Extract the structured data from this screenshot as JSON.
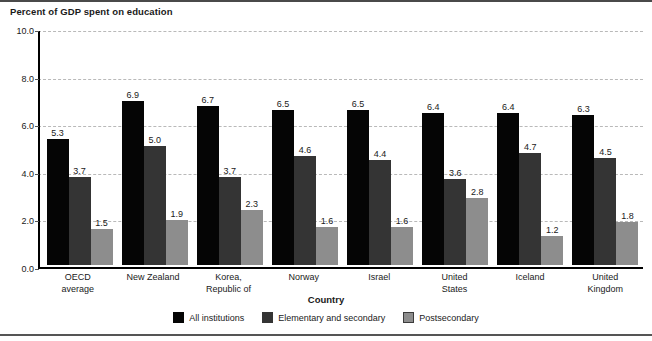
{
  "chart_data": {
    "type": "bar",
    "title": "Percent of GDP spent on education",
    "xlabel": "Country",
    "ylabel": "",
    "ylim": [
      0,
      10
    ],
    "yticks": [
      "0.0",
      "2.0",
      "4.0",
      "6.0",
      "8.0",
      "10.0"
    ],
    "ytick_values": [
      0,
      2,
      4,
      6,
      8,
      10
    ],
    "grid": true,
    "legend_position": "bottom",
    "categories": [
      "OECD average",
      "New Zealand",
      "Korea, Republic of",
      "Norway",
      "Israel",
      "United States",
      "Iceland",
      "United Kingdom"
    ],
    "category_lines": [
      [
        "OECD",
        "average"
      ],
      [
        "New Zealand"
      ],
      [
        "Korea,",
        "Republic of"
      ],
      [
        "Norway"
      ],
      [
        "Israel"
      ],
      [
        "United",
        "States"
      ],
      [
        "Iceland"
      ],
      [
        "United",
        "Kingdom"
      ]
    ],
    "series": [
      {
        "name": "All institutions",
        "color": "#050505",
        "values": [
          5.3,
          6.9,
          6.7,
          6.5,
          6.5,
          6.4,
          6.4,
          6.3
        ],
        "labels": [
          "5.3",
          "6.9",
          "6.7",
          "6.5",
          "6.5",
          "6.4",
          "6.4",
          "6.3"
        ]
      },
      {
        "name": "Elementary and secondary",
        "color": "#343434",
        "values": [
          3.7,
          5.0,
          3.7,
          4.6,
          4.4,
          3.6,
          4.7,
          4.5
        ],
        "labels": [
          "3.7",
          "5.0",
          "3.7",
          "4.6",
          "4.4",
          "3.6",
          "4.7",
          "4.5"
        ]
      },
      {
        "name": "Postsecondary",
        "color": "#8d8d8d",
        "values": [
          1.5,
          1.9,
          2.3,
          1.6,
          1.6,
          2.8,
          1.2,
          1.8
        ],
        "labels": [
          "1.5",
          "1.9",
          "2.3",
          "1.6",
          "1.6",
          "2.8",
          "1.2",
          "1.8"
        ]
      }
    ]
  }
}
